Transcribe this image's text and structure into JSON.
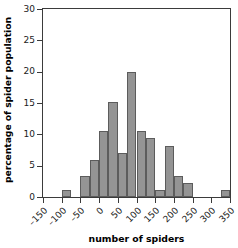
{
  "chart_data": {
    "type": "bar",
    "title": "",
    "subtitle": "",
    "xlabel": "number of spiders",
    "ylabel": "percentage of spider population",
    "xlim": [
      -150,
      350
    ],
    "ylim": [
      0,
      30
    ],
    "bin_width": 25,
    "grid": false,
    "legend": null,
    "bar_color": "#949494",
    "bar_border_color": "#5c5c5c",
    "axis_color": "#3b3b3b",
    "x_tick_labels": [
      "-150",
      "-100",
      "-50",
      "0",
      "50",
      "100",
      "150",
      "200",
      "250",
      "300",
      "350"
    ],
    "x_tick_values": [
      -150,
      -100,
      -50,
      0,
      50,
      100,
      150,
      200,
      250,
      300,
      350
    ],
    "y_tick_labels": [
      "0",
      "5",
      "10",
      "15",
      "20",
      "25",
      "30"
    ],
    "y_tick_values": [
      0,
      5,
      10,
      15,
      20,
      25,
      30
    ],
    "categories": [
      "-150 to -125",
      "-125 to -100",
      "-100 to -75",
      "-75 to -50",
      "-50 to -25",
      "-25 to 0",
      "0 to 25",
      "25 to 50",
      "50 to 75",
      "75 to 100",
      "100 to 125",
      "125 to 150",
      "150 to 175",
      "175 to 200",
      "200 to 225",
      "225 to 250",
      "250 to 275",
      "275 to 300",
      "300 to 325",
      "325 to 350"
    ],
    "bin_starts": [
      -150,
      -125,
      -100,
      -75,
      -50,
      -25,
      0,
      25,
      50,
      75,
      100,
      125,
      150,
      175,
      200,
      225,
      250,
      275,
      300,
      325
    ],
    "values": [
      0,
      0,
      1.1,
      0,
      3.4,
      5.9,
      10.6,
      15.1,
      7.1,
      20.0,
      10.6,
      9.4,
      1.1,
      8.2,
      3.4,
      2.2,
      0,
      0,
      0,
      1.1
    ]
  },
  "axis": {
    "y_title": "percentage of spider population",
    "x_title": "number of spiders"
  }
}
